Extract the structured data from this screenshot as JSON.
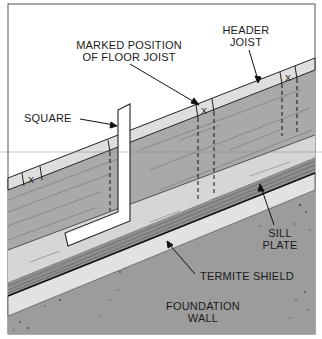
{
  "figure": {
    "type": "construction-diagram"
  },
  "labels": {
    "header_joist": {
      "line1": "HEADER",
      "line2": "JOIST"
    },
    "marked_position": {
      "line1": "MARKED POSITION",
      "line2": "OF FLOOR JOIST"
    },
    "square": "SQUARE",
    "sill_plate": {
      "line1": "SILL",
      "line2": "PLATE"
    },
    "termite_shield": "TERMITE SHIELD",
    "foundation_wall": {
      "line1": "FOUNDATION",
      "line2": "WALL"
    }
  },
  "marks": {
    "joist_mark_symbol": "X",
    "count": 4
  },
  "colors": {
    "background": "#ffffff",
    "frame": "#555555",
    "outline": "#222222",
    "light_band": "#dedede",
    "header_face": "#a9a9a9",
    "sill_top": "#d6d6d6",
    "sill_edge": "#8f8f8f",
    "termite_shield": "#e2e2e2",
    "foundation": "#9c9c9c",
    "square": "#ffffff",
    "text": "#1a1a1a"
  }
}
